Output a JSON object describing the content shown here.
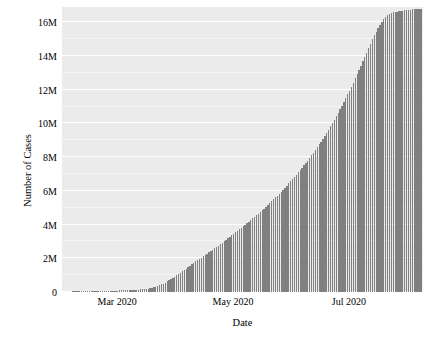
{
  "chart_data": {
    "type": "bar",
    "title": "",
    "subtitle": "",
    "xlabel": "Date",
    "ylabel": "Number of Cases",
    "grid": true,
    "legend": false,
    "legend_position": "none",
    "bar_color": "#808080",
    "panel_color": "#ebebeb",
    "gridline_color": "#ffffff",
    "figure_color": "#ffffff",
    "ylim": [
      0,
      16900000
    ],
    "ytick_labels": [
      "0",
      "2M",
      "4M",
      "6M",
      "8M",
      "10M",
      "12M",
      "14M",
      "16M"
    ],
    "ytick_values": [
      0,
      2000000,
      4000000,
      6000000,
      8000000,
      10000000,
      12000000,
      14000000,
      16000000
    ],
    "xtick_labels": [
      "Mar 2020",
      "May 2020",
      "Jul 2020"
    ],
    "xtick_values": [
      "2020-03-01",
      "2020-05-01",
      "2020-07-01"
    ],
    "xlim": [
      "2020-02-01",
      "2020-08-09"
    ],
    "x": [
      "2020-02-01",
      "2020-02-03",
      "2020-02-05",
      "2020-02-07",
      "2020-02-09",
      "2020-02-11",
      "2020-02-13",
      "2020-02-15",
      "2020-02-17",
      "2020-02-19",
      "2020-02-21",
      "2020-02-23",
      "2020-02-25",
      "2020-02-27",
      "2020-02-29",
      "2020-03-02",
      "2020-03-04",
      "2020-03-06",
      "2020-03-08",
      "2020-03-10",
      "2020-03-12",
      "2020-03-14",
      "2020-03-16",
      "2020-03-18",
      "2020-03-20",
      "2020-03-22",
      "2020-03-24",
      "2020-03-26",
      "2020-03-28",
      "2020-03-30",
      "2020-04-01",
      "2020-04-03",
      "2020-04-05",
      "2020-04-07",
      "2020-04-09",
      "2020-04-11",
      "2020-04-13",
      "2020-04-15",
      "2020-04-17",
      "2020-04-19",
      "2020-04-21",
      "2020-04-23",
      "2020-04-25",
      "2020-04-27",
      "2020-04-29",
      "2020-05-01",
      "2020-05-03",
      "2020-05-05",
      "2020-05-07",
      "2020-05-09",
      "2020-05-11",
      "2020-05-13",
      "2020-05-15",
      "2020-05-17",
      "2020-05-19",
      "2020-05-21",
      "2020-05-23",
      "2020-05-25",
      "2020-05-27",
      "2020-05-29",
      "2020-05-31",
      "2020-06-02",
      "2020-06-04",
      "2020-06-06",
      "2020-06-08",
      "2020-06-10",
      "2020-06-12",
      "2020-06-14",
      "2020-06-16",
      "2020-06-18",
      "2020-06-20",
      "2020-06-22",
      "2020-06-24",
      "2020-06-26",
      "2020-06-28",
      "2020-06-30",
      "2020-07-02",
      "2020-07-04",
      "2020-07-06",
      "2020-07-08",
      "2020-07-10",
      "2020-07-12",
      "2020-07-14",
      "2020-07-16",
      "2020-07-18",
      "2020-07-20",
      "2020-07-22",
      "2020-07-24",
      "2020-07-26",
      "2020-07-28",
      "2020-07-30",
      "2020-08-01",
      "2020-08-03",
      "2020-08-05",
      "2020-08-07"
    ],
    "values": [
      12000,
      20000,
      28000,
      34000,
      40000,
      45000,
      60000,
      67000,
      72000,
      75000,
      78000,
      79000,
      81000,
      83000,
      86000,
      90000,
      95000,
      101000,
      110000,
      120000,
      135000,
      155000,
      182000,
      215000,
      270000,
      340000,
      420000,
      530000,
      660000,
      800000,
      940000,
      1100000,
      1270000,
      1430000,
      1600000,
      1780000,
      1920000,
      2070000,
      2230000,
      2400000,
      2550000,
      2700000,
      2870000,
      3050000,
      3220000,
      3400000,
      3590000,
      3760000,
      3940000,
      4130000,
      4320000,
      4500000,
      4690000,
      4890000,
      5100000,
      5320000,
      5550000,
      5780000,
      6010000,
      6250000,
      6500000,
      6760000,
      7030000,
      7300000,
      7580000,
      7870000,
      8180000,
      8500000,
      8830000,
      9180000,
      9540000,
      9920000,
      10310000,
      10720000,
      11150000,
      11600000,
      12060000,
      12540000,
      13030000,
      13540000,
      14070000,
      14600000,
      15100000,
      15560000,
      15960000,
      16260000,
      16450000,
      16560000,
      16620000,
      16660000,
      16690000,
      16720000,
      16750000,
      16780000,
      16810000
    ]
  }
}
